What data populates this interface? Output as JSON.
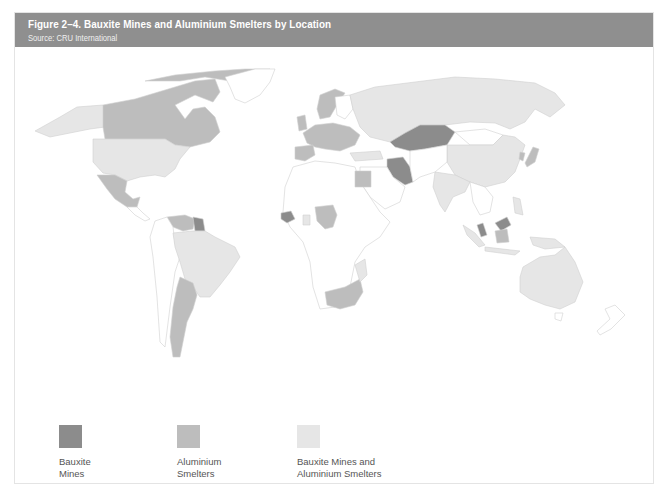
{
  "figure": {
    "title": "Figure 2–4. Bauxite Mines and Aluminium Smelters by Location",
    "source": "Source: CRU International"
  },
  "colors": {
    "title_bar": "#8f8f8f",
    "bauxite_mines": "#8c8c8c",
    "aluminium_smelters": "#bdbdbd",
    "both": "#e6e6e6",
    "none": "#ffffff",
    "border": "#d0d0d0"
  },
  "legend": {
    "items": [
      {
        "label": "Bauxite\nMines",
        "color": "#8c8c8c"
      },
      {
        "label": "Aluminium\nSmelters",
        "color": "#bdbdbd"
      },
      {
        "label": "Bauxite Mines and\nAluminium Smelters",
        "color": "#e6e6e6"
      }
    ]
  },
  "map": {
    "type": "choropleth",
    "categories": [
      "Bauxite Mines",
      "Aluminium Smelters",
      "Bauxite Mines and Aluminium Smelters"
    ],
    "regions": {
      "bauxite_mines": [
        "Kazakhstan",
        "Iran",
        "Guinea",
        "Guyana",
        "Suriname",
        "Malaysia"
      ],
      "aluminium_smelters": [
        "Canada",
        "Mexico",
        "Venezuela",
        "Argentina",
        "Norway",
        "United Kingdom",
        "France",
        "Spain",
        "Germany",
        "Italy",
        "Egypt",
        "Nigeria",
        "Cameroon",
        "South Africa",
        "Japan",
        "Ukraine",
        "Poland",
        "Indonesia",
        "Mozambique"
      ],
      "both": [
        "United States",
        "Alaska",
        "Brazil",
        "Russia",
        "China",
        "India",
        "Australia",
        "Ghana",
        "Turkey",
        "Greece",
        "Papua New Guinea"
      ]
    }
  }
}
